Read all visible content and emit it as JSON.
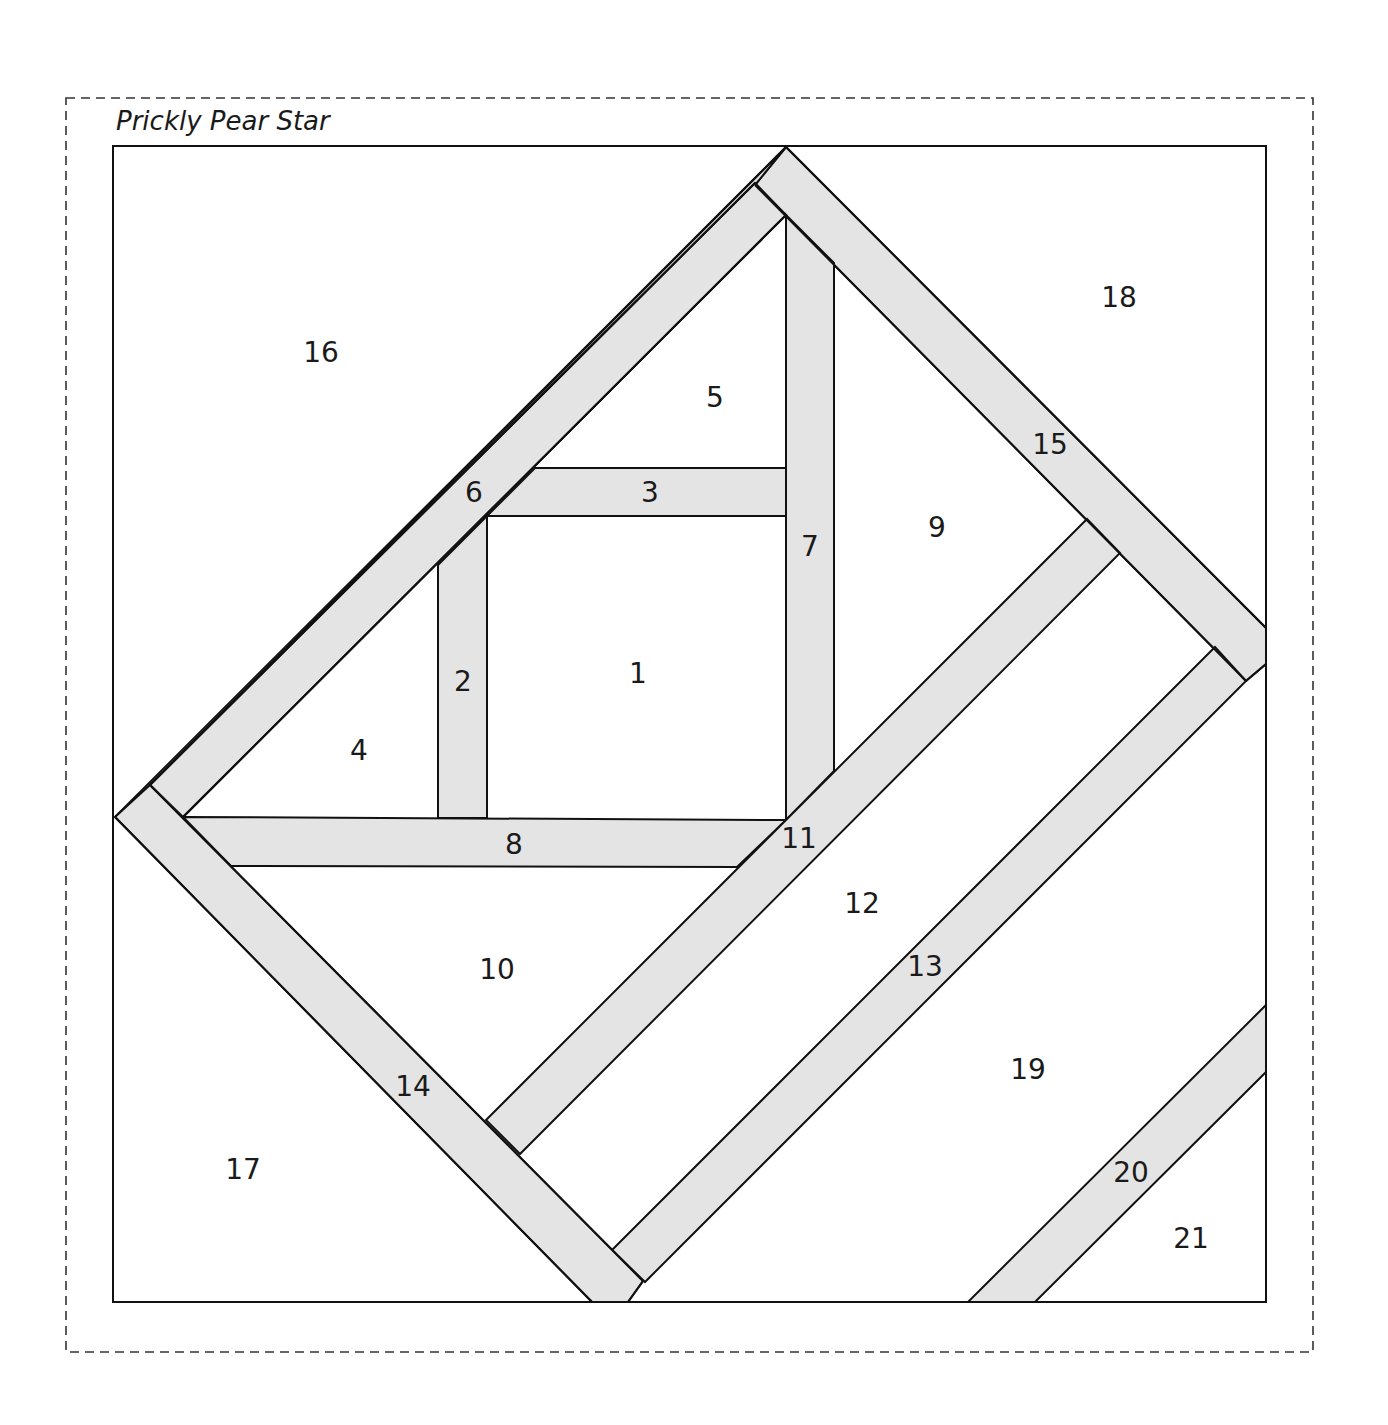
{
  "title": "Prickly Pear Star",
  "colors": {
    "strip_fill": "#e4e4e4",
    "outline": "#111111",
    "background": "#ffffff"
  },
  "frame": {
    "outer_dashed": {
      "x1": 66,
      "y1": 98,
      "x2": 1313,
      "y2": 1352
    },
    "block": {
      "x1": 112,
      "y1": 145,
      "x2": 1266,
      "y2": 1302
    }
  },
  "pieces": [
    {
      "id": "1",
      "label": "1",
      "x": 638,
      "y": 673
    },
    {
      "id": "2",
      "label": "2",
      "x": 463,
      "y": 681
    },
    {
      "id": "3",
      "label": "3",
      "x": 650,
      "y": 492
    },
    {
      "id": "4",
      "label": "4",
      "x": 359,
      "y": 750
    },
    {
      "id": "5",
      "label": "5",
      "x": 715,
      "y": 397
    },
    {
      "id": "6",
      "label": "6",
      "x": 474,
      "y": 492
    },
    {
      "id": "7",
      "label": "7",
      "x": 810,
      "y": 546
    },
    {
      "id": "8",
      "label": "8",
      "x": 514,
      "y": 844
    },
    {
      "id": "9",
      "label": "9",
      "x": 937,
      "y": 527
    },
    {
      "id": "10",
      "label": "10",
      "x": 497,
      "y": 969
    },
    {
      "id": "11",
      "label": "11",
      "x": 799,
      "y": 838
    },
    {
      "id": "12",
      "label": "12",
      "x": 862,
      "y": 903
    },
    {
      "id": "13",
      "label": "13",
      "x": 925,
      "y": 966
    },
    {
      "id": "14",
      "label": "14",
      "x": 413,
      "y": 1086
    },
    {
      "id": "15",
      "label": "15",
      "x": 1050,
      "y": 444
    },
    {
      "id": "16",
      "label": "16",
      "x": 321,
      "y": 352
    },
    {
      "id": "17",
      "label": "17",
      "x": 243,
      "y": 1169
    },
    {
      "id": "18",
      "label": "18",
      "x": 1119,
      "y": 297
    },
    {
      "id": "19",
      "label": "19",
      "x": 1028,
      "y": 1069
    },
    {
      "id": "20",
      "label": "20",
      "x": 1131,
      "y": 1172
    },
    {
      "id": "21",
      "label": "21",
      "x": 1191,
      "y": 1238
    }
  ]
}
